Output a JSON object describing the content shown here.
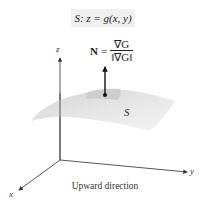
{
  "figure": {
    "surface_equation": "S: z = g(x, y)",
    "normal_formula": {
      "lhs": "N",
      "equals": "=",
      "numerator": "∇G",
      "denominator": "‖∇G‖"
    },
    "surface_label": "S",
    "axes": {
      "x": "x",
      "y": "y",
      "z": "z"
    },
    "caption": "Upward direction",
    "colors": {
      "surface_light": "#ececec",
      "surface_dark": "#c8c8c8",
      "axis": "#333333",
      "label_background": "#f0f0f0"
    }
  }
}
